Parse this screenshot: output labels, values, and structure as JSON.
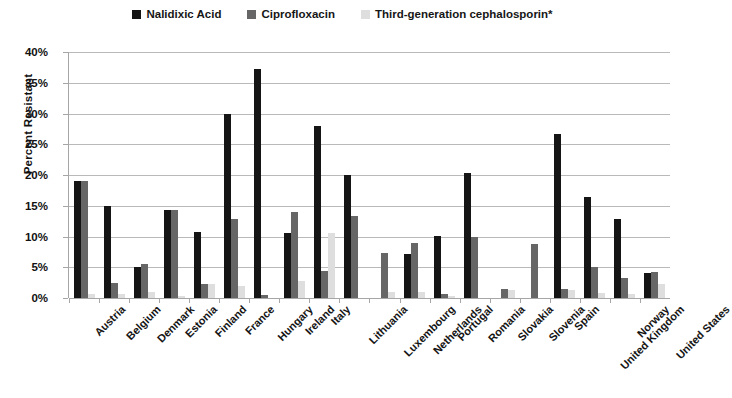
{
  "chart_data": {
    "type": "bar",
    "title": "",
    "xlabel": "",
    "ylabel": "Percent Resistant",
    "ylim": [
      0,
      40
    ],
    "ytick_labels": [
      "40%",
      "35%",
      "30%",
      "25%",
      "20%",
      "15%",
      "10%",
      "5%",
      "0%"
    ],
    "ytick_values": [
      40,
      35,
      30,
      25,
      20,
      15,
      10,
      5,
      0
    ],
    "grid": true,
    "legend_position": "top-center",
    "categories": [
      "Austria",
      "Belgium",
      "Denmark",
      "Estonia",
      "Finland",
      "France",
      "Hungary",
      "Ireland",
      "Italy",
      "Lithuania",
      "Luxembourg",
      "Netherlands",
      "Portugal",
      "Romania",
      "Slovakia",
      "Slovenia",
      "Spain",
      "United Kingdom",
      "Norway",
      "United States"
    ],
    "series": [
      {
        "name": "Nalidixic Acid",
        "color": "#151515",
        "values": [
          19.0,
          15.0,
          5.0,
          14.3,
          10.8,
          30.0,
          37.3,
          10.5,
          28.0,
          20.0,
          0.0,
          7.2,
          10.1,
          20.4,
          0.0,
          0.0,
          26.7,
          16.5,
          12.8,
          4.0
        ]
      },
      {
        "name": "Ciprofloxacin",
        "color": "#666666",
        "values": [
          19.0,
          2.5,
          5.5,
          14.3,
          2.2,
          12.8,
          0.5,
          14.0,
          4.4,
          13.4,
          7.4,
          9.0,
          0.6,
          10.0,
          1.5,
          8.8,
          1.4,
          5.0,
          3.3,
          4.2
        ]
      },
      {
        "name": "Third-generation cephalosporin*",
        "color": "#dedede",
        "values": [
          0.7,
          0.6,
          1.0,
          0.3,
          2.2,
          2.0,
          0.0,
          2.7,
          10.5,
          0.0,
          1.0,
          1.0,
          0.4,
          0.0,
          1.3,
          0.0,
          1.3,
          0.8,
          0.6,
          2.3
        ]
      }
    ]
  }
}
